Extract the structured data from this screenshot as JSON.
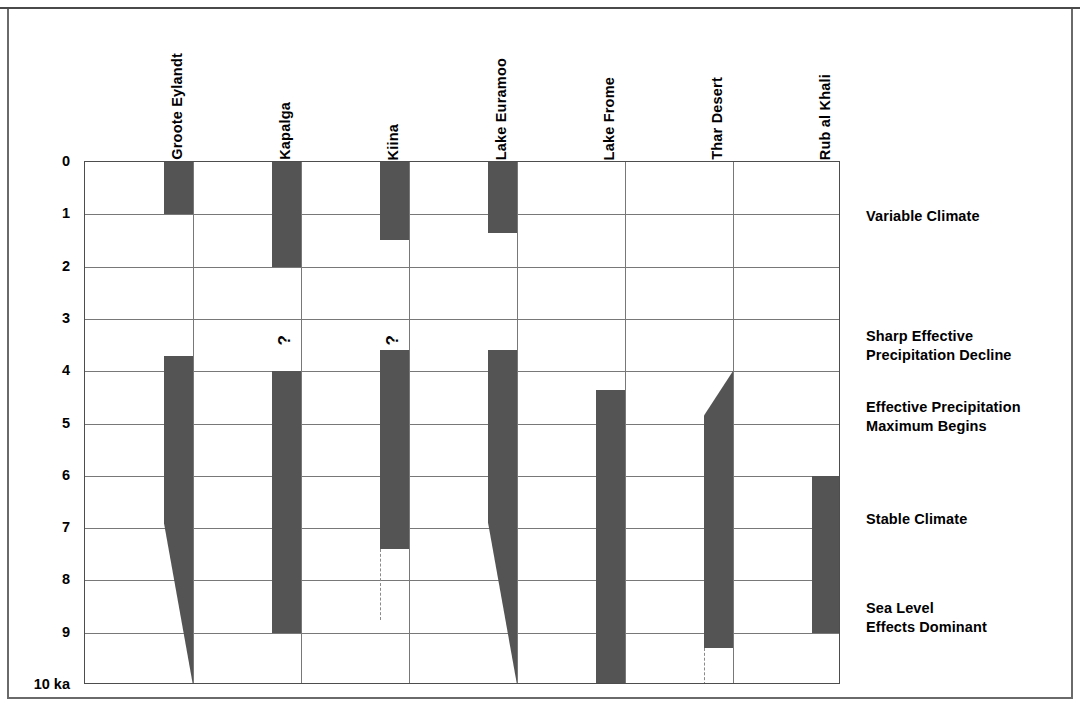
{
  "figure": {
    "axis_unit_label": "10 ka",
    "y_ticks": [
      "0",
      "1",
      "2",
      "3",
      "4",
      "5",
      "6",
      "7",
      "8",
      "9"
    ],
    "colors": {
      "bar_fill": "#545454",
      "gridline": "#787878",
      "frame": "#4d4d4d",
      "text": "#000000"
    }
  },
  "columns": [
    {
      "label": "Groote Eylandt"
    },
    {
      "label": "Kapalga"
    },
    {
      "label": "Kiina"
    },
    {
      "label": "Lake Euramoo"
    },
    {
      "label": "Lake Frome"
    },
    {
      "label": "Thar Desert"
    },
    {
      "label": "Rub al Khali"
    }
  ],
  "annotations": [
    {
      "text": "Variable Climate",
      "at_ka": 1.05
    },
    {
      "text": "Sharp Effective\nPrecipitation Decline",
      "at_ka": 3.35
    },
    {
      "text": "Effective Precipitation\n  Maximum Begins",
      "at_ka": 4.7
    },
    {
      "text": "Stable Climate",
      "at_ka": 6.85
    },
    {
      "text": "Sea Level\nEffects Dominant",
      "at_ka": 8.55
    }
  ],
  "chart_data": {
    "type": "bar",
    "title": "",
    "xlabel": "",
    "ylabel": "ka",
    "ylim": [
      0,
      10
    ],
    "y_inverted": true,
    "grid": true,
    "legend": "none",
    "categories": [
      "Groote Eylandt",
      "Kapalga",
      "Kiina",
      "Lake Euramoo",
      "Lake Frome",
      "Thar Desert",
      "Rub al Khali"
    ],
    "y_tick_values": [
      0,
      1,
      2,
      3,
      4,
      5,
      6,
      7,
      8,
      9,
      10
    ],
    "y_tick_labels": [
      "0",
      "1",
      "2",
      "3",
      "4",
      "5",
      "6",
      "7",
      "8",
      "9",
      "10 ka"
    ],
    "series": [
      {
        "name": "Groote Eylandt",
        "bars": [
          {
            "start_ka": 0.0,
            "end_ka": 1.0,
            "shape": "rect"
          },
          {
            "start_ka": 3.7,
            "end_ka": 10.0,
            "shape": "taper-down",
            "taper_start_ka": 6.9
          }
        ],
        "markers": []
      },
      {
        "name": "Kapalga",
        "bars": [
          {
            "start_ka": 0.0,
            "end_ka": 2.0,
            "shape": "rect"
          },
          {
            "start_ka": 4.0,
            "end_ka": 9.0,
            "shape": "rect"
          }
        ],
        "markers": [
          {
            "symbol": "?",
            "at_ka": 3.5
          }
        ]
      },
      {
        "name": "Kiina",
        "bars": [
          {
            "start_ka": 0.0,
            "end_ka": 1.5,
            "shape": "rect"
          },
          {
            "start_ka": 3.6,
            "end_ka": 7.4,
            "shape": "rect"
          }
        ],
        "markers": [
          {
            "symbol": "?",
            "at_ka": 3.5
          }
        ],
        "dashed_extensions": [
          {
            "from_ka": 7.4,
            "to_ka": 8.75
          }
        ]
      },
      {
        "name": "Lake Euramoo",
        "bars": [
          {
            "start_ka": 0.0,
            "end_ka": 1.35,
            "shape": "rect"
          },
          {
            "start_ka": 3.6,
            "end_ka": 10.0,
            "shape": "taper-down",
            "taper_start_ka": 6.9
          }
        ],
        "markers": []
      },
      {
        "name": "Lake Frome",
        "bars": [
          {
            "start_ka": 4.35,
            "end_ka": 10.0,
            "shape": "rect"
          }
        ],
        "markers": []
      },
      {
        "name": "Thar Desert",
        "bars": [
          {
            "start_ka": 4.0,
            "end_ka": 9.3,
            "shape": "taper-up",
            "taper_end_ka": 4.85
          }
        ],
        "markers": [],
        "dashed_extensions": [
          {
            "from_ka": 9.3,
            "to_ka": 10.0
          }
        ]
      },
      {
        "name": "Rub al Khali",
        "bars": [
          {
            "start_ka": 6.0,
            "end_ka": 9.0,
            "shape": "rect"
          }
        ],
        "markers": []
      }
    ],
    "annotations": [
      {
        "text": "Variable Climate",
        "at_ka": 1.05
      },
      {
        "text": "Sharp Effective Precipitation Decline",
        "at_ka": 3.35
      },
      {
        "text": "Effective Precipitation Maximum Begins",
        "at_ka": 4.7
      },
      {
        "text": "Stable Climate",
        "at_ka": 6.85
      },
      {
        "text": "Sea Level Effects Dominant",
        "at_ka": 8.55
      }
    ]
  }
}
